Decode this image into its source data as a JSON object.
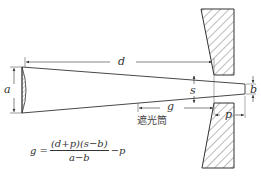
{
  "diagram": {
    "labels": {
      "a": "a",
      "d": "d",
      "s": "s",
      "b": "b",
      "g": "g",
      "p": "p",
      "hood": "遮光筒"
    },
    "formula": {
      "lhs": "g =",
      "numerator": "(d+p)(s−b)",
      "denominator": "a−b",
      "suffix": "−p"
    }
  }
}
